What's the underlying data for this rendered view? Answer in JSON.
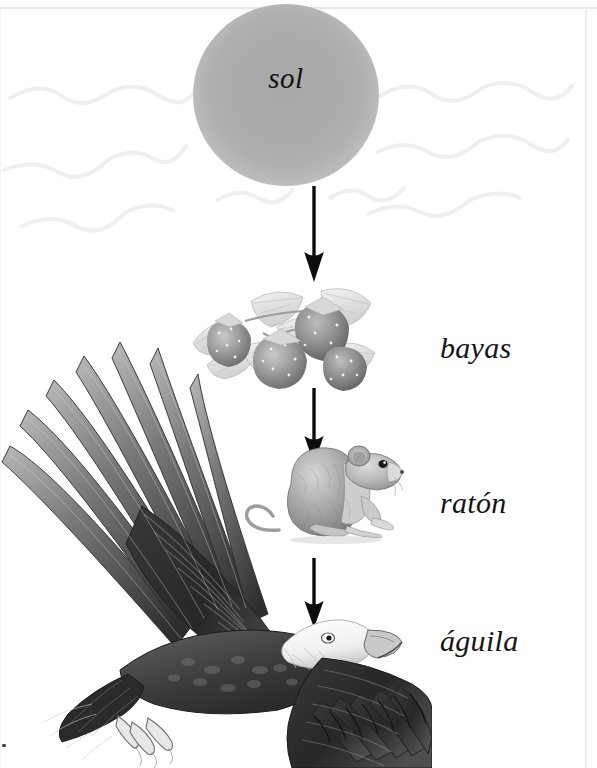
{
  "page": {
    "background_color": "#ffffff",
    "border_color": "#e9e9e9",
    "width": 597,
    "height": 768
  },
  "diagram": {
    "type": "food-chain",
    "direction": "top-to-bottom",
    "language": "es",
    "nodes": [
      {
        "id": "sol",
        "label": "sol",
        "label_position": "inside",
        "illustration": "sun-disc",
        "color": "#adadad"
      },
      {
        "id": "bayas",
        "label": "bayas",
        "label_position": "right",
        "illustration": "strawberries-with-leaves",
        "color": "#8d8d8d"
      },
      {
        "id": "raton",
        "label": "ratón",
        "label_position": "right",
        "illustration": "mouse",
        "color": "#949494"
      },
      {
        "id": "aguila",
        "label": "águila",
        "label_position": "right",
        "illustration": "bald-eagle-flying",
        "color": "#3a3a3a"
      }
    ],
    "arrows": [
      {
        "from": "sol",
        "to": "bayas",
        "style": "solid-down",
        "color": "#0d0d0d"
      },
      {
        "from": "bayas",
        "to": "raton",
        "style": "solid-down",
        "color": "#0d0d0d"
      },
      {
        "from": "raton",
        "to": "aguila",
        "style": "solid-down",
        "color": "#0d0d0d"
      }
    ],
    "rays": {
      "name": "sun-rays",
      "style": "wavy",
      "color": "#f0f0f0",
      "count": 6
    }
  }
}
